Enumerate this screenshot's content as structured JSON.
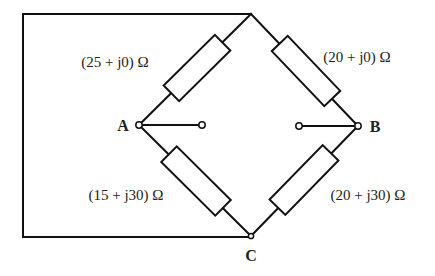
{
  "diagram": {
    "type": "bridge-circuit",
    "nodes": {
      "A": {
        "label": "A"
      },
      "B": {
        "label": "B"
      },
      "C": {
        "label": "C"
      }
    },
    "impedances": [
      {
        "id": "z_top_left",
        "label": "(25 + j0) Ω",
        "between": [
          "A",
          "top"
        ]
      },
      {
        "id": "z_top_right",
        "label": "(20 + j0) Ω",
        "between": [
          "top",
          "B"
        ]
      },
      {
        "id": "z_bottom_left",
        "label": "(15 + j30) Ω",
        "between": [
          "A",
          "C"
        ]
      },
      {
        "id": "z_bottom_right",
        "label": "(20 + j30) Ω",
        "between": [
          "C",
          "B"
        ]
      }
    ],
    "colors": {
      "line": "#111111",
      "text": "#222222",
      "background": "#ffffff"
    }
  }
}
